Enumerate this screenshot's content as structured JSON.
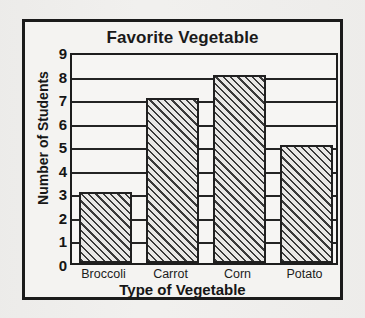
{
  "chart_data": {
    "type": "bar",
    "title": "Favorite Vegetable",
    "xlabel": "Type of Vegetable",
    "ylabel": "Number of Students",
    "categories": [
      "Broccoli",
      "Carrot",
      "Corn",
      "Potato"
    ],
    "values": [
      3,
      7,
      8,
      5
    ],
    "ytick_labels": [
      "0",
      "1",
      "2",
      "3",
      "4",
      "5",
      "6",
      "7",
      "8",
      "9"
    ],
    "ylim": [
      0,
      9
    ],
    "ytick_step": 1,
    "grid": true,
    "legend": false,
    "bar_fill": "diagonal-hatch",
    "colors": {
      "background": "#f1f0ee",
      "frame": "#1b1b1b",
      "axis": "#1d1d1d",
      "gridline": "#242424",
      "bar_outline": "#202020",
      "bar_hatch": "#3a3a3a",
      "bar_fill": "#e9e8e6",
      "text": "#161616"
    }
  }
}
